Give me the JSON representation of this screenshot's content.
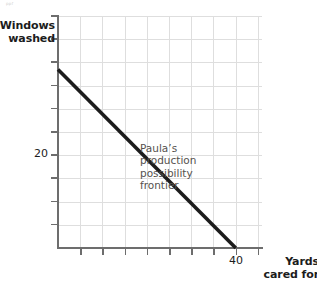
{
  "figure": {
    "artifact_text": "ppf",
    "background_color": "#ffffff"
  },
  "axes": {
    "y_title_line1": "Windows",
    "y_title_line2": "washed",
    "x_title_line1": "Yards",
    "x_title_line2": "cared for",
    "y_tick_label": "20",
    "x_tick_label": "40",
    "axis_color": "#6d6d6d",
    "grid_color": "#dedede"
  },
  "annotation": {
    "line1": "Paula’s",
    "line2": "production",
    "line3": "possibility",
    "line4": "frontier",
    "color": "#55514e"
  },
  "chart_data": {
    "type": "line",
    "title": "",
    "subtitle": "",
    "xlabel": "Yards cared for",
    "ylabel": "Windows washed",
    "xlim": [
      0,
      45.9
    ],
    "ylim": [
      0,
      26.0
    ],
    "grid": true,
    "legend": false,
    "x_ticks": [
      5,
      10,
      15,
      20,
      25,
      30,
      35,
      40,
      45
    ],
    "x_tick_labels": [
      "",
      "",
      "",
      "",
      "",
      "",
      "",
      "40",
      ""
    ],
    "y_ticks": [
      2.5,
      5,
      7.5,
      10,
      12.5,
      15,
      17.5,
      20,
      22.5,
      25
    ],
    "y_tick_labels": [
      "",
      "",
      "",
      "",
      "",
      "",
      "",
      "20",
      "",
      ""
    ],
    "series": [
      {
        "name": "Paula’s production possibility frontier",
        "color": "#1c1c1c",
        "linewidth": 3.6,
        "x": [
          0,
          40
        ],
        "y": [
          20,
          0
        ]
      }
    ],
    "annotations": [
      {
        "text": "Paula’s production possibility frontier",
        "x": 18.5,
        "y": 21.2
      }
    ]
  }
}
